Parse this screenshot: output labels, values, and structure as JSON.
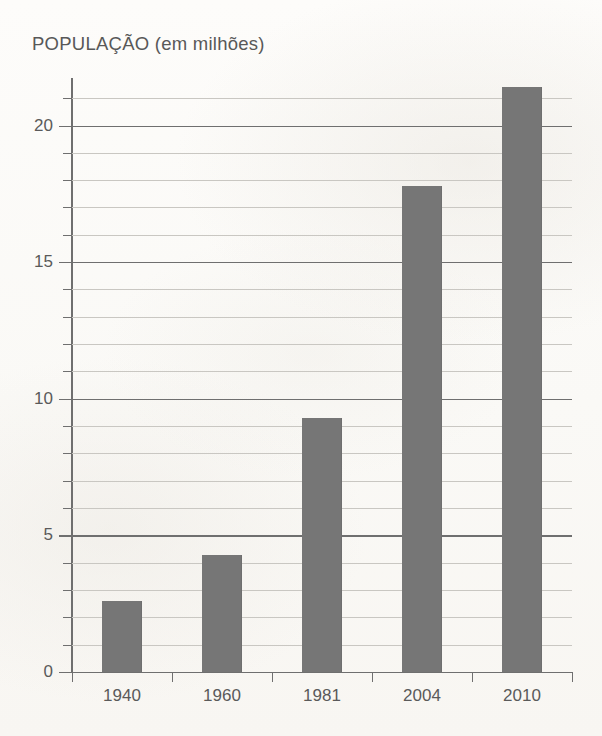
{
  "page": {
    "background_color": "#fcfbf9"
  },
  "chart_data": {
    "type": "bar",
    "title": "POPULAÇÃO (em milhões)",
    "xlabel": "",
    "ylabel": "",
    "categories": [
      "1940",
      "1960",
      "1981",
      "2004",
      "2010"
    ],
    "values": [
      2.6,
      4.3,
      9.3,
      17.8,
      21.4
    ],
    "ylim": [
      0,
      21.7
    ],
    "y_major_ticks": [
      0,
      5,
      10,
      15,
      20
    ],
    "y_minor_tick_step": 1,
    "y_tick_labels": [
      "0",
      "5",
      "10",
      "15",
      "20"
    ],
    "grid": true,
    "legend": false,
    "bar_color": "#767676",
    "axis_color": "#6f6f6f",
    "gridline_color": "#c9c7c2",
    "text_color": "#5a5a5a"
  }
}
